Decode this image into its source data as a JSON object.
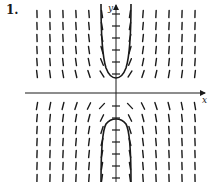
{
  "figure": {
    "problem_number": "1.",
    "x_axis_label": "x",
    "y_axis_label": "y",
    "colors": {
      "ink": "#1a1a1a",
      "background": "#ffffff"
    }
  },
  "chart_data": {
    "type": "slope_field",
    "title": "1.",
    "xlabel": "x",
    "ylabel": "y",
    "grid": false,
    "origin_px": [
      116,
      93
    ],
    "columns_px": [
      37,
      50,
      63,
      76,
      89,
      102,
      130,
      143,
      156,
      169,
      182,
      195
    ],
    "rows_px": [
      14,
      26,
      38,
      50,
      62,
      74,
      106,
      118,
      130,
      142,
      154,
      166,
      178
    ],
    "y_axis_ticks_px": [
      14,
      26,
      38,
      50,
      62,
      74,
      106,
      118,
      130,
      142,
      154,
      166,
      178
    ],
    "slope_pattern": "slope sign follows sign(x*y); marks flatten near the axes and become near-vertical away from the origin",
    "solution_curves": [
      {
        "name": "upper-solution",
        "shape": "U opening upward",
        "vertex_px": [
          116,
          78
        ],
        "asymptotes_px_x": [
          100,
          132
        ]
      },
      {
        "name": "lower-solution",
        "shape": "U opening downward",
        "vertex_px": [
          116,
          119
        ],
        "asymptotes_px_x": [
          100,
          132
        ]
      }
    ]
  }
}
